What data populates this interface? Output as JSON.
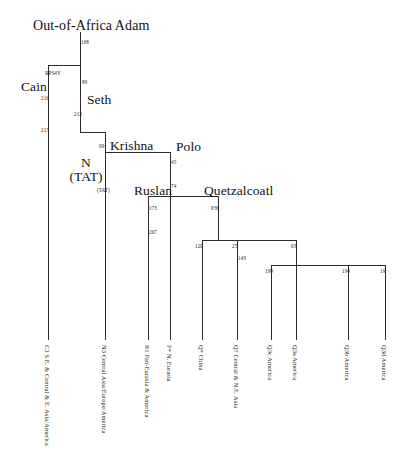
{
  "figure": {
    "type": "phylogenetic-tree",
    "orientation": "top-down",
    "background_color": "#ffffff",
    "line_color": "#2b2b2b"
  },
  "nodes": {
    "root": {
      "name": "Out-of-Africa Adam",
      "marker": "168"
    },
    "cain": {
      "name": "Cain",
      "marker": "RPS4Y"
    },
    "seth": {
      "name": "Seth",
      "marker": "89"
    },
    "krishna": {
      "name": "Krishna",
      "marker": "09"
    },
    "n_tat": {
      "name_line1": "N",
      "name_line2": "(TAT)",
      "marker": "(TAT)"
    },
    "polo": {
      "name": "Polo",
      "marker": "45"
    },
    "ruslan": {
      "name": "Ruslan",
      "marker": "173"
    },
    "quetzalcoatl": {
      "name": "Quetzalcoatl",
      "marker": "P36"
    }
  },
  "edge_labels": {
    "root_stem": "168",
    "cain_upper": "216",
    "cain_lower": "217",
    "seth_upper": "89",
    "seth_lower": "213",
    "krishna_node": "09",
    "n_tat_marker": "(TAT)",
    "polo_upper": "45",
    "polo_lower": "74",
    "ruslan_upper": "173",
    "ruslan_lower": "207",
    "quetz_stem": "P36",
    "q_child_1": "120",
    "q_child_2": "25",
    "q_child_2_sub": "143",
    "q_child_3": "03",
    "q3_child_1": "199",
    "q3_child_2": "194",
    "q3_child_3": "19"
  },
  "leaves": [
    {
      "id": "C3",
      "haplogroup": "C3",
      "region": "S.E. & Central & E. Asia/America"
    },
    {
      "id": "N3",
      "haplogroup": "N3",
      "region": "Central Asia/Europe/America"
    },
    {
      "id": "R1",
      "haplogroup": "R1",
      "region": "Pan-Eurasia & America"
    },
    {
      "id": "P*",
      "haplogroup": "P*",
      "region": "N. Eurasia"
    },
    {
      "id": "Q*",
      "haplogroup": "Q*",
      "region": "China"
    },
    {
      "id": "Q?",
      "haplogroup": "Q?",
      "region": "Central & N.E. Asia"
    },
    {
      "id": "Q3c",
      "haplogroup": "Q3c",
      "region": "America"
    },
    {
      "id": "Q3a",
      "haplogroup": "Q3a",
      "region": "America"
    },
    {
      "id": "Q3b",
      "haplogroup": "Q3b",
      "region": "America"
    },
    {
      "id": "Q3d",
      "haplogroup": "Q3d",
      "region": "America"
    }
  ]
}
